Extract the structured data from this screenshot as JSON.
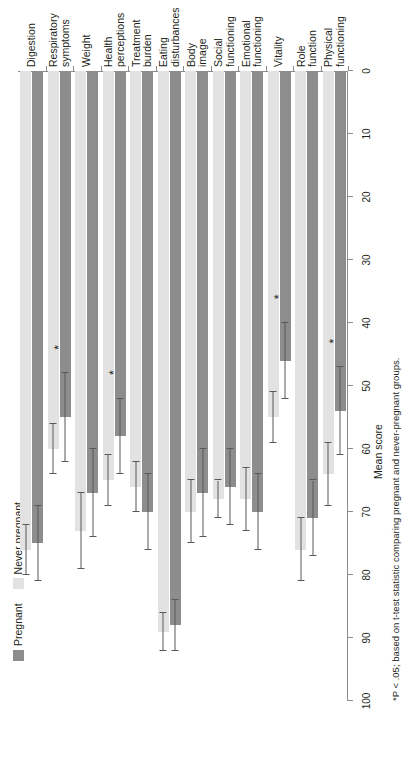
{
  "figure": {
    "value_axis_title": "Mean score",
    "footnote": "*P < .05; based on t-test statistic comparing pregnant and never-pregnant groups."
  },
  "legend": {
    "position": "top-left",
    "items": [
      {
        "label": "Pregnant",
        "color": "#8d8d8d"
      },
      {
        "label": "Never pregnant",
        "color": "#e2e2e2"
      }
    ]
  },
  "colors": {
    "pregnant": "#8d8d8d",
    "never_pregnant": "#e2e2e2",
    "axis": "#8c8c8c",
    "error_bar": "#58595b",
    "text": "#231f20"
  },
  "chart_data": {
    "type": "bar",
    "orientation": "horizontal",
    "title": "",
    "xlabel": "",
    "ylabel": "Mean score",
    "ylim": [
      0,
      100
    ],
    "yticks": [
      0,
      10,
      20,
      30,
      40,
      50,
      60,
      70,
      80,
      90,
      100
    ],
    "grid": false,
    "legend_position": "top-left",
    "significance_marker": "*",
    "categories": [
      "Physical functioning",
      "Role function",
      "Vitality",
      "Emotional functioning",
      "Social functioning",
      "Body image",
      "Eating disturbances",
      "Treatment burden",
      "Health perceptions",
      "Weight",
      "Respiratory symptoms",
      "Digestion"
    ],
    "category_lines": [
      [
        "Physical",
        "functioning"
      ],
      [
        "Role",
        "function"
      ],
      [
        "Vitality"
      ],
      [
        "Emotional",
        "functioning"
      ],
      [
        "Social",
        "functioning"
      ],
      [
        "Body",
        "image"
      ],
      [
        "Eating",
        "disturbances"
      ],
      [
        "Treatment",
        "burden"
      ],
      [
        "Health",
        "perceptions"
      ],
      [
        "Weight"
      ],
      [
        "Respiratory",
        "symptoms"
      ],
      [
        "Digestion"
      ]
    ],
    "series": [
      {
        "name": "Pregnant",
        "color": "#8d8d8d",
        "values": [
          54,
          71,
          46,
          70,
          66,
          67,
          88,
          70,
          58,
          67,
          55,
          75
        ],
        "err_low": [
          47,
          65,
          40,
          64,
          60,
          60,
          84,
          64,
          52,
          60,
          48,
          69
        ],
        "err_high": [
          61,
          77,
          52,
          76,
          72,
          74,
          92,
          76,
          64,
          74,
          62,
          81
        ]
      },
      {
        "name": "Never pregnant",
        "color": "#e2e2e2",
        "values": [
          64,
          76,
          55,
          68,
          68,
          70,
          89,
          66,
          65,
          73,
          60,
          76
        ],
        "err_low": [
          59,
          71,
          51,
          63,
          65,
          65,
          86,
          62,
          61,
          67,
          56,
          72
        ],
        "err_high": [
          69,
          81,
          59,
          73,
          71,
          75,
          92,
          70,
          69,
          79,
          64,
          80
        ]
      }
    ],
    "significant_categories": [
      "Physical functioning",
      "Vitality",
      "Health perceptions",
      "Respiratory symptoms"
    ]
  }
}
